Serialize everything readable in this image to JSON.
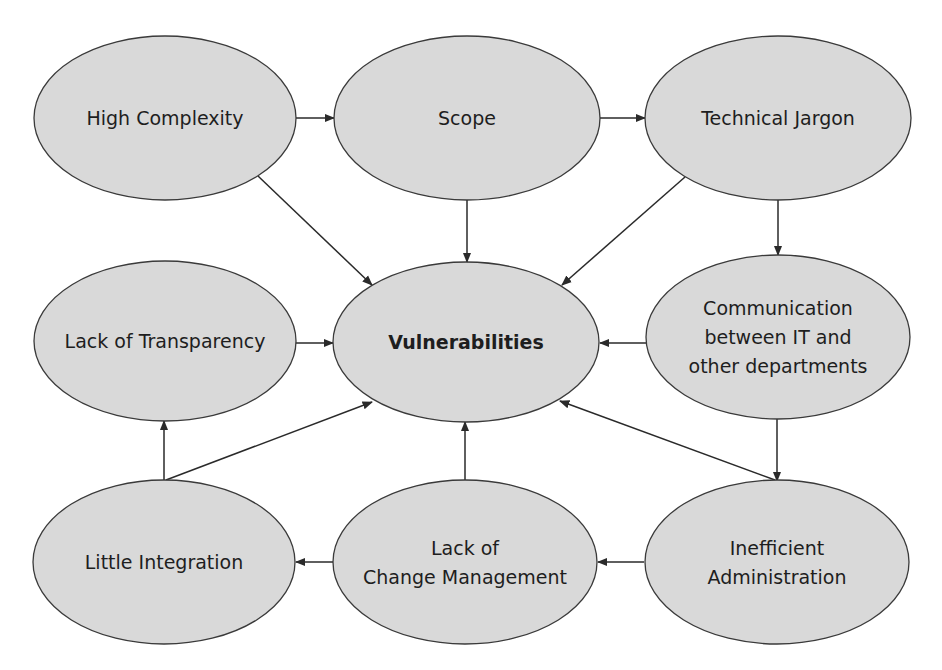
{
  "diagram": {
    "type": "cause-effect network",
    "colors": {
      "node_fill": "#d9d9d9",
      "node_stroke": "#3a3a3a",
      "edge": "#2a2a2a",
      "text": "#1e1e1e",
      "background": "#ffffff"
    },
    "nodes": [
      {
        "id": "high-complexity",
        "lines": [
          "High Complexity"
        ],
        "bold": false
      },
      {
        "id": "scope",
        "lines": [
          "Scope"
        ],
        "bold": false
      },
      {
        "id": "technical-jargon",
        "lines": [
          "Technical Jargon"
        ],
        "bold": false
      },
      {
        "id": "lack-of-transparency",
        "lines": [
          "Lack of Transparency"
        ],
        "bold": false
      },
      {
        "id": "vulnerabilities",
        "lines": [
          "Vulnerabilities"
        ],
        "bold": true
      },
      {
        "id": "communication",
        "lines": [
          "Communication",
          "between IT and",
          "other departments"
        ],
        "bold": false
      },
      {
        "id": "little-integration",
        "lines": [
          "Little Integration"
        ],
        "bold": false
      },
      {
        "id": "lack-of-change-management",
        "lines": [
          "Lack of",
          "Change Management"
        ],
        "bold": false
      },
      {
        "id": "inefficient-administration",
        "lines": [
          "Inefficient",
          "Administration"
        ],
        "bold": false
      }
    ],
    "edges": [
      {
        "from": "high-complexity",
        "to": "scope"
      },
      {
        "from": "scope",
        "to": "technical-jargon"
      },
      {
        "from": "high-complexity",
        "to": "vulnerabilities"
      },
      {
        "from": "scope",
        "to": "vulnerabilities"
      },
      {
        "from": "technical-jargon",
        "to": "vulnerabilities"
      },
      {
        "from": "technical-jargon",
        "to": "communication"
      },
      {
        "from": "lack-of-transparency",
        "to": "vulnerabilities"
      },
      {
        "from": "communication",
        "to": "vulnerabilities"
      },
      {
        "from": "communication",
        "to": "inefficient-administration"
      },
      {
        "from": "little-integration",
        "to": "lack-of-transparency"
      },
      {
        "from": "little-integration",
        "to": "vulnerabilities"
      },
      {
        "from": "lack-of-change-management",
        "to": "vulnerabilities"
      },
      {
        "from": "lack-of-change-management",
        "to": "little-integration"
      },
      {
        "from": "inefficient-administration",
        "to": "lack-of-change-management"
      },
      {
        "from": "inefficient-administration",
        "to": "vulnerabilities"
      }
    ]
  }
}
